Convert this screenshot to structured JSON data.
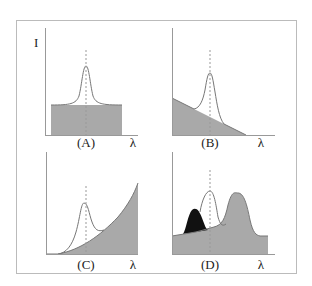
{
  "figure": {
    "y_axis_label": "I",
    "x_axis_label": "λ",
    "colors": {
      "background_fill": "#a9a9a9",
      "dark_fill": "#111111",
      "curve": "#777777",
      "axis": "#999999",
      "frame": "#bbbbbb"
    },
    "panels": [
      {
        "id": "A",
        "label": "(A)",
        "x_label": "λ",
        "background": "flat"
      },
      {
        "id": "B",
        "label": "(B)",
        "x_label": "λ",
        "background": "decreasing-linear"
      },
      {
        "id": "C",
        "label": "(C)",
        "x_label": "λ",
        "background": "increasing-curved"
      },
      {
        "id": "D",
        "label": "(D)",
        "x_label": "λ",
        "background": "overlapping-peaks"
      }
    ]
  }
}
